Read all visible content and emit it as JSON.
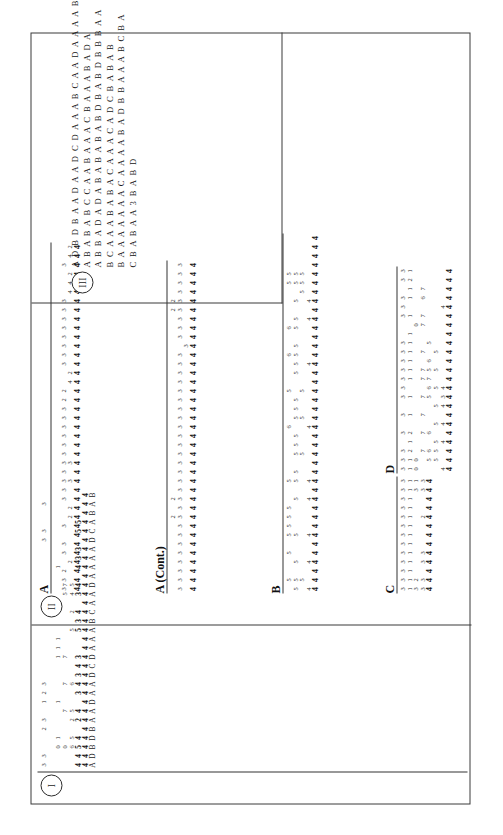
{
  "document": {
    "orientation": "landscape-rotated-90",
    "background_color": "#ffffff",
    "ink_color": "#1a1a1a",
    "border_color": "#3a3a3a"
  },
  "sections": [
    {
      "numeral": "I",
      "label": "I"
    },
    {
      "numeral": "II",
      "label": "II"
    },
    {
      "numeral": "III",
      "label": "III"
    }
  ],
  "panels": {
    "section1": {
      "header": ""
    },
    "A": {
      "header": "A"
    },
    "ACont": {
      "header": "A (Cont.)"
    },
    "B": {
      "header": "B"
    },
    "C": {
      "header": "C"
    },
    "D": {
      "header": "D"
    }
  },
  "section1_rows": {
    "letters": [
      "A",
      "D",
      "B",
      "D",
      "B",
      "A",
      "A",
      "D",
      "A",
      "A",
      "D",
      "C",
      "D",
      "A",
      "A",
      "A",
      "B",
      "C",
      "A",
      "A",
      "D",
      "A",
      "A",
      "A",
      "A",
      "D",
      "C",
      "A",
      "B",
      "A",
      "B"
    ],
    "line_key": [
      "4",
      "4",
      "4",
      "4",
      "4",
      "4",
      "4",
      "4",
      "4",
      "4",
      "4",
      "4",
      "4",
      "4",
      "4",
      "4",
      "4",
      "4",
      "4",
      "4",
      "4",
      "4",
      "4",
      "4",
      "4",
      "4",
      "4",
      "4",
      "4",
      "4",
      "4"
    ],
    "line_bold": [
      "4",
      "4",
      "5",
      "4",
      "",
      "2",
      "4",
      "",
      "3",
      "4",
      "3",
      "4",
      "3",
      "",
      "",
      "5",
      "3",
      "4",
      "",
      "3",
      "4",
      "",
      "4",
      "3",
      "3",
      "",
      "5",
      "5",
      "",
      " ",
      ""
    ],
    "line_3": [
      "",
      "",
      "6",
      "5",
      "",
      "2",
      "5",
      "",
      "",
      "6",
      "",
      "",
      "",
      "",
      "",
      "5",
      "",
      "2",
      "",
      "4",
      "5",
      "",
      "",
      "",
      "",
      "",
      "",
      "",
      " ",
      "",
      ""
    ],
    "line_4": [
      "",
      "",
      "0",
      "",
      "",
      "",
      "7",
      "",
      "",
      "7",
      "",
      "",
      "7",
      "",
      "",
      "",
      "",
      "",
      "",
      "5",
      "7",
      "",
      "",
      "",
      "",
      "",
      "",
      "",
      "",
      "",
      ""
    ],
    "line_5": [
      "",
      "",
      "0",
      "1",
      "",
      "",
      "",
      "1",
      "",
      "",
      "",
      "",
      "1",
      "1",
      "1",
      "",
      "",
      "",
      "1",
      "",
      "",
      "",
      "1",
      "",
      "",
      "",
      "",
      "",
      "",
      "",
      ""
    ],
    "line_6": [
      "",
      "",
      "",
      "",
      "",
      "",
      "",
      "",
      "",
      "",
      "",
      "",
      "",
      "",
      "",
      "",
      "",
      "",
      "",
      "",
      "",
      "",
      "",
      "",
      "",
      "",
      "",
      "",
      "",
      "",
      ""
    ],
    "line_top": [
      "3",
      "3",
      "",
      "",
      "2",
      "3",
      "",
      "1",
      "2",
      "3",
      "",
      "",
      "",
      "",
      "",
      "",
      "",
      "",
      "",
      "",
      "",
      "",
      "",
      "",
      "",
      "3",
      "3",
      "",
      "",
      "3",
      ""
    ]
  },
  "panel_A": {
    "key_row": [
      "4",
      "4",
      "4",
      "4",
      "4",
      "4",
      "4",
      "4",
      "4",
      "4",
      "4",
      "4",
      "4",
      "4",
      "4",
      "4",
      "4",
      "4",
      "4",
      "4",
      "4",
      "4",
      "4",
      "4",
      "4",
      "4",
      "4",
      "4",
      "4",
      "4",
      "4",
      "4",
      "4",
      "4",
      "4",
      "4",
      "4",
      "4",
      "4"
    ],
    "bold_row": [
      "",
      "",
      "",
      "2",
      "",
      "",
      "",
      "",
      "2",
      "2",
      "",
      "",
      "3",
      "",
      "3",
      "",
      "",
      "",
      "",
      "",
      "",
      "",
      "",
      "4",
      "2",
      "",
      "",
      "",
      "",
      "",
      "",
      "",
      "",
      "4",
      "4",
      "2",
      "",
      "4",
      "2"
    ],
    "mid_row": [
      "3",
      "3",
      "2",
      "",
      "3",
      "3",
      "",
      "3",
      "",
      "",
      "3",
      "3",
      "3",
      "3",
      "3",
      "3",
      "3",
      "3",
      "3",
      "3",
      "3",
      "2",
      "2",
      "",
      "",
      "3",
      "3",
      "3",
      "3",
      "3",
      "3",
      "3",
      "3",
      "",
      "",
      "",
      "3",
      "",
      ""
    ],
    "top_row": [
      "",
      "",
      "",
      "",
      "",
      "",
      "",
      "",
      "",
      "",
      "",
      "",
      "",
      "",
      "",
      "",
      "",
      "",
      "",
      "",
      "",
      "",
      "",
      "",
      "",
      "",
      "",
      "",
      "",
      "",
      "",
      "",
      "",
      "",
      "",
      "",
      "",
      "",
      ""
    ]
  },
  "panel_A_cont": {
    "key_row": [
      "4",
      "4",
      "4",
      "4",
      "4",
      "4",
      "4",
      "4",
      "4",
      "4",
      "4",
      "4",
      "4",
      "4",
      "4",
      "4",
      "4",
      "4",
      "4",
      "4",
      "4",
      "4",
      "4",
      "4",
      "4",
      "4",
      "4",
      "4",
      "4",
      "4",
      "4",
      "4",
      "4",
      "4",
      "4",
      "4",
      "4"
    ],
    "bold_row": [
      "",
      "",
      "",
      "",
      "",
      "",
      "",
      "",
      "",
      "",
      "",
      "",
      "",
      "",
      "",
      "",
      "",
      "",
      "",
      "",
      "",
      "",
      "",
      "",
      "",
      "",
      "",
      "3",
      "",
      "",
      "",
      "",
      "",
      "",
      "",
      "",
      ""
    ],
    "mid_row": [
      "3",
      "3",
      "3",
      "3",
      "3",
      "3",
      "3",
      "3",
      "3",
      "3",
      "3",
      "3",
      "3",
      "3",
      "3",
      "3",
      "3",
      "3",
      "3",
      "3",
      "3",
      "3",
      "3",
      "3",
      "3",
      "3",
      "3",
      "",
      "3",
      "3",
      "3",
      "3",
      "3",
      "3",
      "3",
      "3",
      "3"
    ],
    "top_row": [
      "",
      "",
      "",
      "",
      "",
      "",
      "",
      "",
      "2",
      "",
      "2",
      "",
      "",
      "",
      "",
      "",
      "",
      "",
      "",
      "",
      "",
      "",
      "",
      "",
      "",
      "",
      "",
      "",
      "",
      "",
      "",
      "2",
      "2",
      "",
      "",
      "",
      ""
    ]
  },
  "panel_B": {
    "key_row": [
      "4",
      "4",
      "4",
      "4",
      "4",
      "4",
      "4",
      "4",
      "4",
      "4",
      "4",
      "4",
      "4",
      "4",
      "4",
      "4",
      "4",
      "4",
      "4",
      "4",
      "4",
      "4",
      "4",
      "4",
      "4",
      "4",
      "4",
      "4",
      "4",
      "4",
      "4",
      "4",
      "4",
      "4",
      "4",
      "4",
      "4",
      "4",
      "4",
      "4"
    ],
    "bold_row": [
      "4",
      "",
      "",
      "4",
      "",
      "",
      "4",
      "",
      "",
      "",
      "4",
      "",
      "4",
      "",
      "",
      "",
      "",
      "",
      "4",
      "",
      "",
      "",
      "",
      "",
      "",
      "4",
      "",
      "",
      "",
      "",
      "4",
      "",
      "4",
      "",
      "",
      "",
      "",
      "",
      "",
      ""
    ],
    "low_row": [
      "",
      "5",
      "",
      "",
      "",
      "",
      "",
      "",
      "",
      "",
      "",
      "",
      "",
      "",
      "",
      "5",
      "",
      "",
      "",
      "5",
      "",
      "",
      "5",
      "",
      "",
      "",
      "",
      "",
      "",
      "",
      "",
      "",
      "",
      "5",
      "5",
      "5",
      "",
      "",
      "",
      ""
    ],
    "mid_row": [
      "5",
      "5",
      "",
      "5",
      "",
      "",
      "5",
      "",
      "",
      "",
      "5",
      "",
      "5",
      "5",
      "",
      "5",
      "5",
      "5",
      "",
      "5",
      "5",
      "5",
      "",
      "",
      "5",
      "5",
      "5",
      "5",
      "",
      "5",
      "5",
      "",
      "5",
      "",
      "5",
      "5",
      "",
      "",
      "",
      ""
    ],
    "hi_row": [
      "",
      "5",
      "",
      "",
      "5",
      "",
      "5",
      "5",
      "5",
      "5",
      "",
      "",
      "5",
      "",
      "",
      "",
      "",
      "",
      "6",
      "",
      "",
      "",
      "5",
      "",
      "",
      "",
      "6",
      "",
      "",
      "6",
      "",
      "",
      "",
      "",
      "5",
      "5",
      "",
      "",
      "",
      ""
    ]
  },
  "panel_C": {
    "key_row": [
      "4",
      "4",
      "4",
      "4",
      "4",
      "4",
      "4",
      "4",
      "4",
      "4",
      "4",
      "4",
      "4"
    ],
    "r2_row": [
      "3",
      "3",
      "",
      "3",
      "3",
      "",
      "",
      "",
      "2",
      "",
      "",
      "3",
      "3"
    ],
    "r3_row": [
      "3",
      "2",
      "",
      "",
      "",
      "",
      "",
      "",
      "",
      "",
      "",
      "3",
      "1"
    ],
    "r4_row": [
      "1",
      "1",
      "1",
      "1",
      "1",
      "1",
      "1",
      "1",
      "1",
      "1",
      "1",
      "1",
      "1"
    ],
    "r5_row": [
      "3",
      "3",
      "3",
      "3",
      "3",
      "3",
      "3",
      "3",
      "3",
      "3",
      "3",
      "3",
      "3"
    ]
  },
  "panel_D": {
    "key_row": [
      "4",
      "4",
      "4",
      "4",
      "4",
      "4",
      "4",
      "4",
      "4",
      "4",
      "4",
      "4",
      "4",
      "4",
      "4",
      "4",
      "4",
      "4",
      "4",
      "4",
      "4",
      "4",
      "4"
    ],
    "bold_row": [
      "4",
      "",
      "",
      "4",
      "",
      "4",
      "",
      "4",
      "3",
      "4",
      "",
      "",
      "",
      "",
      "",
      "",
      "",
      "",
      "4",
      "",
      "",
      "",
      ""
    ],
    "r_five": [
      "",
      "5",
      "5",
      "5",
      "",
      "5",
      "",
      "5",
      "",
      "5",
      "",
      "5",
      "",
      "5",
      "",
      "",
      "",
      "",
      "",
      "",
      "",
      "",
      ""
    ],
    "r_six": [
      "",
      "5",
      "6",
      "",
      "6",
      "",
      "",
      "",
      "5",
      "6",
      "7",
      "5",
      "6",
      "",
      "5",
      "",
      "",
      "",
      "",
      "",
      "",
      "",
      ""
    ],
    "r_seven": [
      "",
      "",
      "7",
      "",
      "7",
      "",
      "7",
      "",
      "7",
      "",
      "7",
      "7",
      "",
      "7",
      "",
      "",
      "7",
      "7",
      "",
      "6",
      "7",
      "",
      ""
    ],
    "r_zero": [
      "0",
      "0",
      "",
      "",
      "",
      "",
      "",
      "",
      "",
      "",
      "",
      "",
      "",
      "",
      "",
      "",
      "0",
      "",
      "",
      "",
      "",
      "",
      ""
    ],
    "r_one": [
      "1",
      "1",
      "2",
      "1",
      "2",
      "",
      "1",
      "",
      "1",
      "",
      "1",
      "1",
      "1",
      "1",
      "1",
      "1",
      "",
      "1",
      "",
      "1",
      "1",
      "2",
      "1"
    ],
    "r_three": [
      "3",
      "3",
      "3",
      "",
      "3",
      "",
      "3",
      "",
      "3",
      "3",
      "3",
      "3",
      "3",
      "3",
      "3",
      "",
      "",
      "3",
      "3",
      "3",
      "",
      "3",
      "3"
    ]
  },
  "section3_strings": [
    "A D B D B A A D A A D C D A A A B C A A D A A A A B",
    "A B A B A B C C A A B A A A C B A A A B A D A",
    "A B B A D A D A B A B A B A B D B A B D B B B A A",
    "B C A A A B A B A C A A A C A D C B A B A B",
    "B A A A A A A A C A A A A B A D B B A A A B C B A",
    "C B A B A A 3 B A B D"
  ]
}
